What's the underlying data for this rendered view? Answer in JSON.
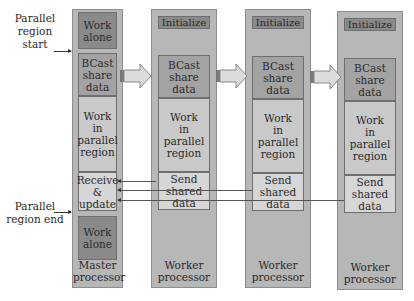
{
  "side_labels": {
    "parallel_start": "Parallel\nregion start",
    "parallel_end": "Parallel\nregion end"
  },
  "master": {
    "work_alone_top": "Work\nalone",
    "bcast": "BCast\nshare\ndata",
    "work_parallel": "Work\nin\nparallel\nregion",
    "receive": "Receive\n&\nupdate",
    "work_alone_bottom": "Work\nalone",
    "footer": "Master\nprocessor"
  },
  "workers": [
    {
      "init": "Initialize",
      "bcast": "BCast\nshare\ndata",
      "work_parallel": "Work\nin\nparallel\nregion",
      "send": "Send\nshared\ndata",
      "footer": "Worker\nprocessor"
    },
    {
      "init": "Initialize",
      "bcast": "BCast\nshare\ndata",
      "work_parallel": "Work\nin\nparallel\nregion",
      "send": "Send\nshared\ndata",
      "footer": "Worker\nprocessor"
    },
    {
      "init": "Initialize",
      "bcast": "BCast\nshare\ndata",
      "work_parallel": "Work\nin\nparallel\nregion",
      "send": "Send\nshared\ndata",
      "footer": "Worker\nprocessor"
    }
  ],
  "colors": {
    "column": "#b7b7b7",
    "dark_block": "#8a8a8a",
    "medium_block": "#a3a3a3",
    "light_block": "#c9c9c9"
  }
}
